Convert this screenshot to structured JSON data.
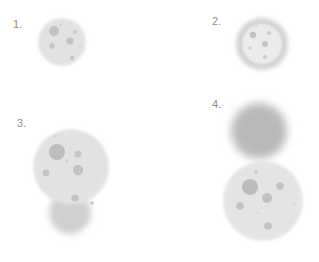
{
  "figure": {
    "background_color": "#ffffff",
    "width": 319,
    "height": 262
  },
  "palette": {
    "background": "#ffffff",
    "label_text": "#8d8d8d",
    "body_light": "#e2e2e2",
    "body_light_alt": "#e6e6e6",
    "body_inner_pale": "#ebebeb",
    "ring_gray": "#d2d2d2",
    "solid_gray": "#b9b9b9",
    "spot_mid": "#c0c0c0",
    "spot_dark": "#b2b2b2",
    "spot_faint": "#d4d4d4",
    "shadow_gray": "#cfcfcf"
  },
  "panels": [
    {
      "id": "panel-1",
      "label": "1.",
      "label_x": 13,
      "label_y": 19,
      "description": "Single pale round cell with scattered darker granules",
      "shapes": [
        {
          "name": "cell-body",
          "kind": "disc",
          "cx": 62,
          "cy": 42,
          "r": 24,
          "fill": "#e2e2e2",
          "blur": 1.4
        }
      ],
      "spots": [
        {
          "cx": 54,
          "cy": 31,
          "r": 5.0,
          "fill": "#c2c2c2"
        },
        {
          "cx": 70,
          "cy": 41,
          "r": 3.6,
          "fill": "#c2c2c2"
        },
        {
          "cx": 52,
          "cy": 46,
          "r": 2.7,
          "fill": "#c5c5c5"
        },
        {
          "cx": 75,
          "cy": 32,
          "r": 2.1,
          "fill": "#c9c9c9"
        },
        {
          "cx": 72,
          "cy": 58,
          "r": 2.4,
          "fill": "#c7c7c7"
        },
        {
          "cx": 61,
          "cy": 25,
          "r": 1.3,
          "fill": "#d2d2d2"
        },
        {
          "cx": 80,
          "cy": 47,
          "r": 1.0,
          "fill": "#d6d6d6"
        }
      ]
    },
    {
      "id": "panel-2",
      "label": "2.",
      "label_x": 212,
      "label_y": 16,
      "description": "Round cell with a distinct darker outer ring and pale interior",
      "shapes": [
        {
          "name": "outer-ring",
          "kind": "disc",
          "cx": 262,
          "cy": 44,
          "r": 26,
          "fill": "#d2d2d2",
          "blur": 2.0
        },
        {
          "name": "inner-disc",
          "kind": "disc",
          "cx": 262,
          "cy": 44,
          "r": 20,
          "fill": "#ebebeb",
          "blur": 1.0
        }
      ],
      "spots": [
        {
          "cx": 253,
          "cy": 35,
          "r": 3.2,
          "fill": "#c4c4c4"
        },
        {
          "cx": 265,
          "cy": 44,
          "r": 3.0,
          "fill": "#c2c2c2"
        },
        {
          "cx": 269,
          "cy": 33,
          "r": 2.0,
          "fill": "#cdcdcd"
        },
        {
          "cx": 250,
          "cy": 48,
          "r": 1.8,
          "fill": "#d0d0d0"
        },
        {
          "cx": 265,
          "cy": 57,
          "r": 2.0,
          "fill": "#cacaca"
        },
        {
          "cx": 257,
          "cy": 26,
          "r": 1.1,
          "fill": "#d8d8d8"
        }
      ]
    },
    {
      "id": "panel-3",
      "label": "3.",
      "label_x": 17,
      "label_y": 118,
      "description": "Large pale cell with many granules, overlapped below by a second smaller blurred cell",
      "shapes": [
        {
          "name": "lower-overlap-cell",
          "kind": "disc",
          "cx": 70,
          "cy": 213,
          "r": 21,
          "fill": "#cfcfcf",
          "blur": 3.0
        },
        {
          "name": "main-cell-body",
          "kind": "disc",
          "cx": 71,
          "cy": 167,
          "r": 38,
          "fill": "#e2e2e2",
          "blur": 1.6
        }
      ],
      "spots": [
        {
          "cx": 57,
          "cy": 152,
          "r": 8.0,
          "fill": "#bdbdbd"
        },
        {
          "cx": 78,
          "cy": 170,
          "r": 5.2,
          "fill": "#c2c2c2"
        },
        {
          "cx": 78,
          "cy": 154,
          "r": 3.6,
          "fill": "#c6c6c6"
        },
        {
          "cx": 46,
          "cy": 173,
          "r": 3.4,
          "fill": "#c4c4c4"
        },
        {
          "cx": 75,
          "cy": 198,
          "r": 3.6,
          "fill": "#c3c3c3"
        },
        {
          "cx": 92,
          "cy": 203,
          "r": 2.0,
          "fill": "#cdcdcd"
        },
        {
          "cx": 67,
          "cy": 161,
          "r": 1.4,
          "fill": "#d2d2d2"
        },
        {
          "cx": 55,
          "cy": 136,
          "r": 1.5,
          "fill": "#d4d4d4"
        },
        {
          "cx": 96,
          "cy": 180,
          "r": 1.2,
          "fill": "#d6d6d6"
        }
      ]
    },
    {
      "id": "panel-4",
      "label": "4.",
      "label_x": 212,
      "label_y": 99,
      "description": "Uniform dark blurred cell above a larger pale granular cell",
      "shapes": [
        {
          "name": "upper-solid-cell",
          "kind": "disc",
          "cx": 259,
          "cy": 131,
          "r": 28,
          "fill": "#b9b9b9",
          "blur": 4.0
        },
        {
          "name": "lower-granular-cell",
          "kind": "disc",
          "cx": 263,
          "cy": 201,
          "r": 40,
          "fill": "#e4e4e4",
          "blur": 1.6
        }
      ],
      "spots": [
        {
          "cx": 250,
          "cy": 187,
          "r": 8.0,
          "fill": "#bcbcbc"
        },
        {
          "cx": 267,
          "cy": 198,
          "r": 5.0,
          "fill": "#c1c1c1"
        },
        {
          "cx": 280,
          "cy": 186,
          "r": 3.8,
          "fill": "#c3c3c3"
        },
        {
          "cx": 240,
          "cy": 206,
          "r": 3.8,
          "fill": "#c3c3c3"
        },
        {
          "cx": 268,
          "cy": 226,
          "r": 3.8,
          "fill": "#c3c3c3"
        },
        {
          "cx": 256,
          "cy": 172,
          "r": 2.0,
          "fill": "#cfcfcf"
        },
        {
          "cx": 258,
          "cy": 190,
          "r": 1.3,
          "fill": "#d4d4d4"
        },
        {
          "cx": 258,
          "cy": 213,
          "r": 1.2,
          "fill": "#d6d6d6"
        },
        {
          "cx": 294,
          "cy": 204,
          "r": 1.2,
          "fill": "#d8d8d8"
        }
      ]
    }
  ]
}
